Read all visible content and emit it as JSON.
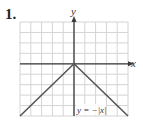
{
  "problem_number": "1.",
  "chart_data": {
    "type": "line",
    "title": "",
    "xlabel": "x",
    "ylabel": "y",
    "equation_label": "y = −|x|",
    "grid": true,
    "xlim": [
      -5,
      5
    ],
    "ylim": [
      -5,
      4
    ],
    "series": [
      {
        "name": "y = −|x|",
        "x": [
          -5,
          0,
          5
        ],
        "y": [
          -5,
          0,
          -5
        ]
      }
    ]
  },
  "colors": {
    "grid": "#d4d4d4",
    "axis": "#3a3a3a",
    "curve": "#555555"
  }
}
